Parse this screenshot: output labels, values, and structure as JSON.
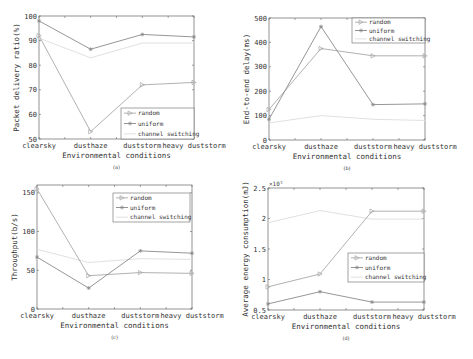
{
  "figure": {
    "x_categories": [
      "clearsky",
      "dusthaze",
      "duststorm",
      "heavy duststorm"
    ],
    "series_styles": {
      "random": {
        "color": "#a8a8a8",
        "marker": "triangle-right"
      },
      "uniform": {
        "color": "#8a8a8a",
        "marker": "star"
      },
      "channel switching": {
        "color": "#dcdcdc",
        "marker": "none"
      }
    }
  },
  "chart_data": [
    {
      "id": "a",
      "type": "line",
      "caption": "(a)",
      "title": "",
      "xlabel": "Environmental conditions",
      "ylabel": "Packet delivery ratio(%)",
      "categories": [
        "clearsky",
        "dusthaze",
        "duststorm",
        "heavy duststorm"
      ],
      "ylim": [
        50,
        100
      ],
      "yticks": [
        50,
        60,
        70,
        80,
        90,
        100
      ],
      "ytick_labels": [
        "50",
        "60",
        "70",
        "80",
        "90",
        "100"
      ],
      "exponent_label": "",
      "grid": false,
      "legend_position": "lower right",
      "legend": [
        "random",
        "uniform",
        "channel switching"
      ],
      "series": [
        {
          "name": "random",
          "values": [
            92,
            53,
            72,
            73
          ]
        },
        {
          "name": "uniform",
          "values": [
            98,
            86.5,
            92.5,
            91.5
          ]
        },
        {
          "name": "channel switching",
          "values": [
            91,
            83,
            89,
            89
          ]
        }
      ]
    },
    {
      "id": "b",
      "type": "line",
      "caption": "(b)",
      "title": "",
      "xlabel": "Environmental conditions",
      "ylabel": "End-to-end delay(ms)",
      "categories": [
        "clearsky",
        "dusthaze",
        "duststorm",
        "heavy duststorm"
      ],
      "ylim": [
        0,
        500
      ],
      "yticks": [
        0,
        100,
        200,
        300,
        400,
        500
      ],
      "ytick_labels": [
        "0",
        "100",
        "200",
        "300",
        "400",
        "500"
      ],
      "exponent_label": "",
      "grid": false,
      "legend_position": "upper right",
      "legend": [
        "random",
        "uniform",
        "channel switching"
      ],
      "series": [
        {
          "name": "random",
          "values": [
            125,
            375,
            345,
            345
          ]
        },
        {
          "name": "uniform",
          "values": [
            85,
            465,
            145,
            148
          ]
        },
        {
          "name": "channel switching",
          "values": [
            70,
            100,
            85,
            80
          ]
        }
      ]
    },
    {
      "id": "c",
      "type": "line",
      "caption": "(c)",
      "title": "",
      "xlabel": "Environmental conditions",
      "ylabel": "Throughput(b/s)",
      "categories": [
        "clearsky",
        "dusthaze",
        "duststorm",
        "heavy duststorm"
      ],
      "ylim": [
        0,
        160
      ],
      "yticks": [
        0,
        50,
        100,
        150
      ],
      "ytick_labels": [
        "0",
        "50",
        "100",
        "150"
      ],
      "exponent_label": "",
      "grid": false,
      "legend_position": "upper right",
      "legend": [
        "random",
        "uniform",
        "channel switching"
      ],
      "series": [
        {
          "name": "random",
          "values": [
            155,
            43,
            47,
            46
          ]
        },
        {
          "name": "uniform",
          "values": [
            67,
            27,
            75,
            72
          ]
        },
        {
          "name": "channel switching",
          "values": [
            77,
            60,
            65,
            64
          ]
        }
      ]
    },
    {
      "id": "d",
      "type": "line",
      "caption": "(d)",
      "title": "",
      "xlabel": "Environmental conditions",
      "ylabel": "Average energy consumption(mJ)",
      "categories": [
        "clearsky",
        "dusthaze",
        "duststorm",
        "heavy duststorm"
      ],
      "ylim": [
        0.5,
        2.5
      ],
      "yticks": [
        0.5,
        1,
        1.5,
        2,
        2.5
      ],
      "ytick_labels": [
        "0.5",
        "1",
        "1.5",
        "2",
        "2.5"
      ],
      "exponent_label": "×10⁵",
      "grid": false,
      "legend_position": "center right",
      "legend": [
        "random",
        "uniform",
        "channel switching"
      ],
      "series": [
        {
          "name": "random",
          "values": [
            0.88,
            1.09,
            2.12,
            2.12
          ]
        },
        {
          "name": "uniform",
          "values": [
            0.6,
            0.8,
            0.63,
            0.63
          ]
        },
        {
          "name": "channel switching",
          "values": [
            1.93,
            2.13,
            1.99,
            1.99
          ]
        }
      ]
    }
  ]
}
